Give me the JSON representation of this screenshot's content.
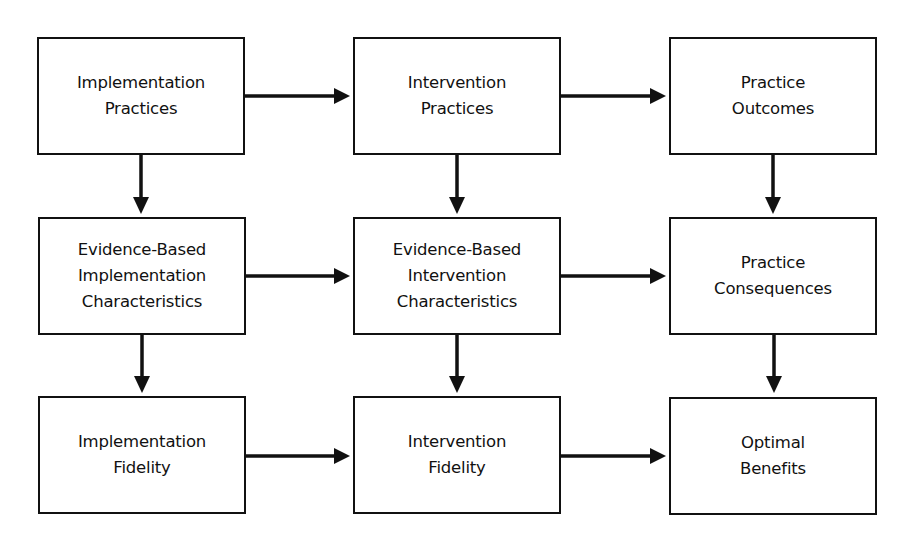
{
  "diagram": {
    "type": "flowchart-grid",
    "nodes": [
      {
        "id": "impl_practices",
        "lines": [
          "Implementation",
          "Practices"
        ],
        "row": 0,
        "col": 0
      },
      {
        "id": "interv_practices",
        "lines": [
          "Intervention",
          "Practices"
        ],
        "row": 0,
        "col": 1
      },
      {
        "id": "practice_outcomes",
        "lines": [
          "Practice",
          "Outcomes"
        ],
        "row": 0,
        "col": 2
      },
      {
        "id": "eb_impl_char",
        "lines": [
          "Evidence-Based",
          "Implementation",
          "Characteristics"
        ],
        "row": 1,
        "col": 0
      },
      {
        "id": "eb_interv_char",
        "lines": [
          "Evidence-Based",
          "Intervention",
          "Characteristics"
        ],
        "row": 1,
        "col": 1
      },
      {
        "id": "practice_consequences",
        "lines": [
          "Practice",
          "Consequences"
        ],
        "row": 1,
        "col": 2
      },
      {
        "id": "impl_fidelity",
        "lines": [
          "Implementation",
          "Fidelity"
        ],
        "row": 2,
        "col": 0
      },
      {
        "id": "interv_fidelity",
        "lines": [
          "Intervention",
          "Fidelity"
        ],
        "row": 2,
        "col": 1
      },
      {
        "id": "optimal_benefits",
        "lines": [
          "Optimal",
          "Benefits"
        ],
        "row": 2,
        "col": 2
      }
    ],
    "edges": [
      {
        "from": "impl_practices",
        "to": "interv_practices"
      },
      {
        "from": "interv_practices",
        "to": "practice_outcomes"
      },
      {
        "from": "eb_impl_char",
        "to": "eb_interv_char"
      },
      {
        "from": "eb_interv_char",
        "to": "practice_consequences"
      },
      {
        "from": "impl_fidelity",
        "to": "interv_fidelity"
      },
      {
        "from": "interv_fidelity",
        "to": "optimal_benefits"
      },
      {
        "from": "impl_practices",
        "to": "eb_impl_char"
      },
      {
        "from": "eb_impl_char",
        "to": "impl_fidelity"
      },
      {
        "from": "interv_practices",
        "to": "eb_interv_char"
      },
      {
        "from": "eb_interv_char",
        "to": "interv_fidelity"
      },
      {
        "from": "practice_outcomes",
        "to": "practice_consequences"
      },
      {
        "from": "practice_consequences",
        "to": "optimal_benefits"
      }
    ],
    "colors": {
      "stroke": "#111111",
      "fill": "#ffffff",
      "text": "#111111"
    }
  }
}
